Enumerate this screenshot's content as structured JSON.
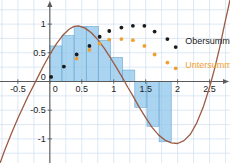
{
  "chart_data": {
    "type": "area",
    "title": "",
    "xlabel": "",
    "ylabel": "",
    "xlim": [
      -0.78,
      2.82
    ],
    "ylim": [
      -1.42,
      1.42
    ],
    "grid": true,
    "x_ticks": [
      -0.5,
      0,
      0.5,
      1,
      1.5,
      2,
      2.5
    ],
    "x_tick_labels": [
      "-0.5",
      "0",
      "0.5",
      "1",
      "1.5",
      "2",
      "2.5"
    ],
    "y_ticks": [
      1,
      0.5,
      0,
      -0.5,
      -1
    ],
    "y_tick_labels": [
      "1",
      "0.5",
      "0",
      "-0.5",
      "-1"
    ],
    "curve": {
      "name": "f",
      "color": "#9c5a43",
      "x_start": -0.78,
      "x_end": 2.82,
      "samples": [
        [
          -0.78,
          -1.42
        ],
        [
          -0.7,
          -1.18
        ],
        [
          -0.6,
          -0.9
        ],
        [
          -0.5,
          -0.64
        ],
        [
          -0.4,
          -0.4
        ],
        [
          -0.35,
          -0.28
        ],
        [
          -0.3,
          -0.17
        ],
        [
          -0.2,
          0.05
        ],
        [
          -0.1,
          0.27
        ],
        [
          0.0,
          0.47
        ],
        [
          0.1,
          0.65
        ],
        [
          0.2,
          0.8
        ],
        [
          0.3,
          0.91
        ],
        [
          0.38,
          0.96
        ],
        [
          0.45,
          0.97
        ],
        [
          0.55,
          0.93
        ],
        [
          0.65,
          0.85
        ],
        [
          0.75,
          0.73
        ],
        [
          0.85,
          0.58
        ],
        [
          0.95,
          0.41
        ],
        [
          1.05,
          0.23
        ],
        [
          1.15,
          0.04
        ],
        [
          1.22,
          -0.1
        ],
        [
          1.3,
          -0.25
        ],
        [
          1.4,
          -0.45
        ],
        [
          1.5,
          -0.63
        ],
        [
          1.6,
          -0.8
        ],
        [
          1.7,
          -0.93
        ],
        [
          1.8,
          -1.02
        ],
        [
          1.9,
          -1.07
        ],
        [
          2.0,
          -1.08
        ],
        [
          2.1,
          -1.03
        ],
        [
          2.2,
          -0.92
        ],
        [
          2.3,
          -0.72
        ],
        [
          2.4,
          -0.45
        ],
        [
          2.5,
          -0.1
        ],
        [
          2.58,
          0.23
        ],
        [
          2.66,
          0.6
        ],
        [
          2.74,
          1.02
        ],
        [
          2.82,
          1.42
        ]
      ]
    },
    "bars": {
      "color": "#8ec6e9",
      "edge_color": "#6aa9d4",
      "opacity": 0.75,
      "x_from": 0.0,
      "x_to": 1.9,
      "width": 0.19,
      "bars": [
        {
          "x0": 0.0,
          "x1": 0.19,
          "height": 0.62
        },
        {
          "x0": 0.19,
          "x1": 0.38,
          "height": 0.8
        },
        {
          "x0": 0.38,
          "x1": 0.57,
          "height": 0.96
        },
        {
          "x0": 0.57,
          "x1": 0.76,
          "height": 0.96
        },
        {
          "x0": 0.76,
          "x1": 0.95,
          "height": 0.72
        },
        {
          "x0": 0.95,
          "x1": 1.14,
          "height": 0.42
        },
        {
          "x0": 1.14,
          "x1": 1.33,
          "height": 0.2
        },
        {
          "x0": 1.33,
          "x1": 1.52,
          "height": -0.45
        },
        {
          "x0": 1.52,
          "x1": 1.71,
          "height": -0.78
        },
        {
          "x0": 1.71,
          "x1": 1.9,
          "height": -1.05
        }
      ]
    },
    "series": [
      {
        "name": "Obersumme",
        "color": "#1a1a1a",
        "marker": "dot",
        "points": [
          [
            0.02,
            0.08
          ],
          [
            0.22,
            0.26
          ],
          [
            0.42,
            0.47
          ],
          [
            0.62,
            0.62
          ],
          [
            0.78,
            0.78
          ],
          [
            0.93,
            0.88
          ],
          [
            1.12,
            0.94
          ],
          [
            1.3,
            0.97
          ],
          [
            1.48,
            0.97
          ],
          [
            1.64,
            0.87
          ],
          [
            1.84,
            0.74
          ],
          [
            1.97,
            0.6
          ]
        ]
      },
      {
        "name": "Untersumme",
        "color": "#f0a030",
        "marker": "dot",
        "points": [
          [
            0.42,
            0.4
          ],
          [
            0.62,
            0.55
          ],
          [
            0.78,
            0.66
          ],
          [
            0.93,
            0.73
          ],
          [
            1.12,
            0.74
          ],
          [
            1.3,
            0.72
          ],
          [
            1.48,
            0.62
          ],
          [
            1.64,
            0.47
          ],
          [
            1.84,
            0.33
          ],
          [
            1.97,
            0.23
          ]
        ]
      }
    ],
    "legend": [
      {
        "label": "Obersumme",
        "color": "#1a1a1a",
        "x": 2.12,
        "y": 0.7
      },
      {
        "label": "Untersumme",
        "color": "#f0a030",
        "x": 2.12,
        "y": 0.28
      }
    ],
    "axis_color": "#5a5a5a",
    "grid_color": "#cfe0ef"
  }
}
